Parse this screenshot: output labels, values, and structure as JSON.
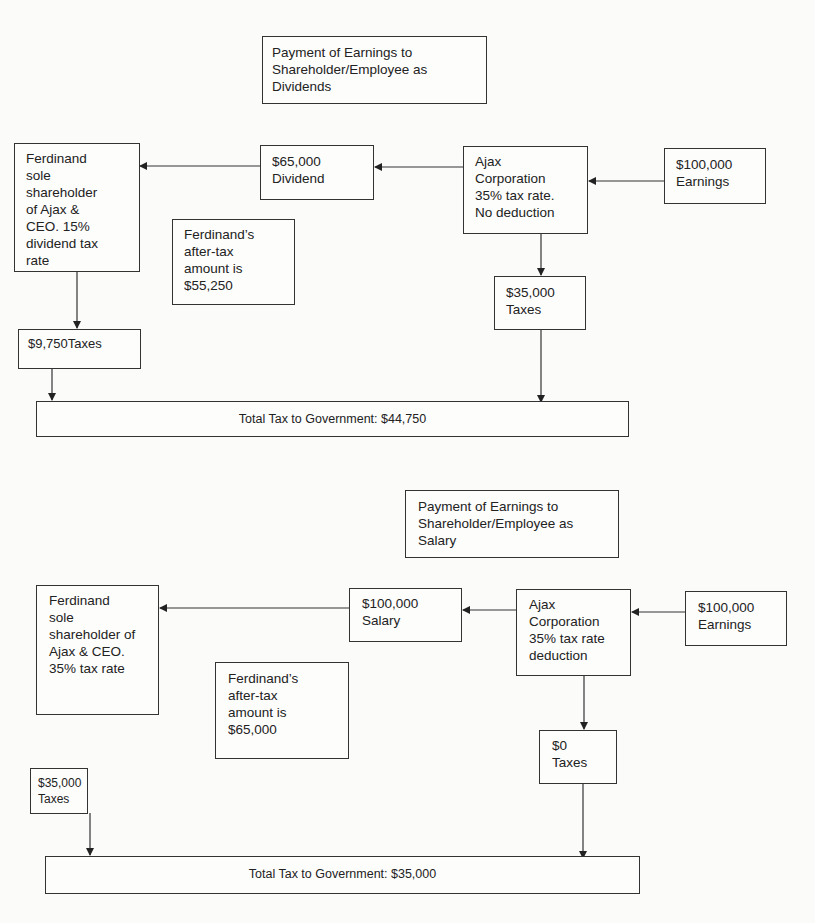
{
  "diagram1": {
    "title": "Payment of Earnings to\nShareholder/Employee as\nDividends",
    "shareholder": "Ferdinand\nsole\nshareholder\nof Ajax &\nCEO.  15%\ndividend tax\nrate",
    "payment": "$65,000\nDividend",
    "corporation": "Ajax\nCorporation\n35% tax rate.\nNo deduction",
    "earnings": "$100,000\nEarnings",
    "after_tax": "Ferdinand’s\nafter-tax\namount is\n$55,250",
    "corp_taxes": "$35,000\nTaxes",
    "personal_taxes": "$9,750Taxes",
    "total": "Total Tax to Government: $44,750"
  },
  "diagram2": {
    "title": "Payment of Earnings to\nShareholder/Employee as\nSalary",
    "shareholder": "Ferdinand\nsole\nshareholder of\nAjax & CEO.\n35% tax rate",
    "payment": "$100,000\nSalary",
    "corporation": "Ajax\nCorporation\n35% tax rate\ndeduction",
    "earnings": "$100,000\nEarnings",
    "after_tax": "Ferdinand’s\nafter-tax\namount is\n$65,000",
    "corp_taxes": "$0\nTaxes",
    "personal_taxes": "$35,000\nTaxes",
    "total": "Total Tax to Government: $35,000"
  }
}
